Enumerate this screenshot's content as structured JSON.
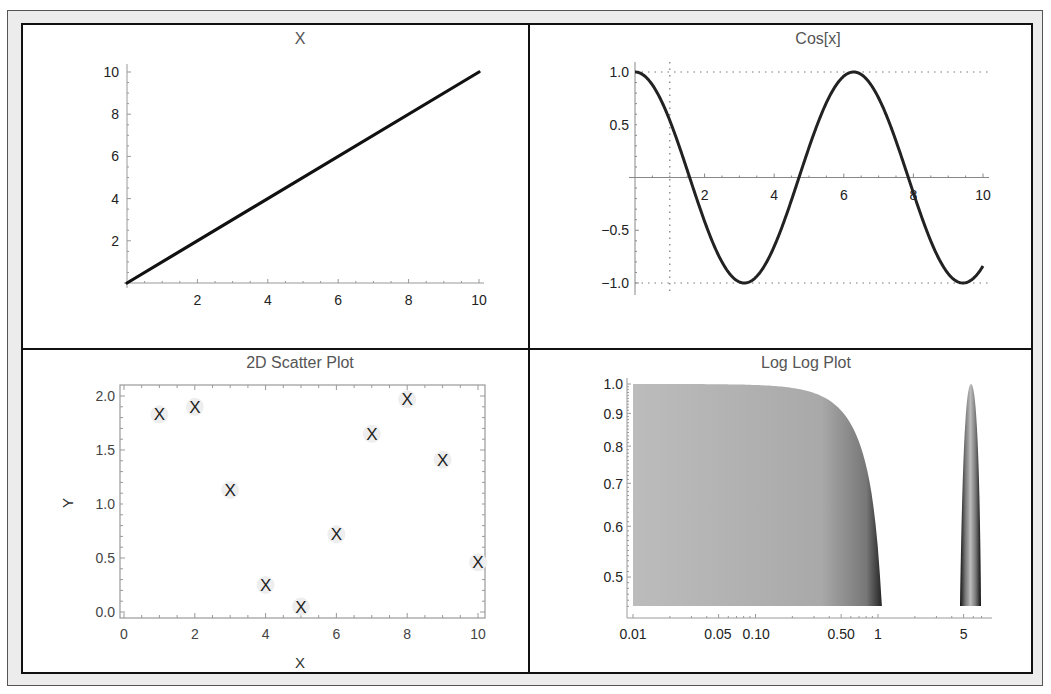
{
  "chart_data": [
    {
      "id": "linear",
      "type": "line",
      "title": "X",
      "function": "x",
      "x": [
        0,
        10
      ],
      "values": [
        0,
        10
      ],
      "xlim": [
        0,
        10
      ],
      "ylim": [
        0,
        10
      ],
      "xticks": [
        "2",
        "4",
        "6",
        "8",
        "10"
      ],
      "yticks": [
        "2",
        "4",
        "6",
        "8",
        "10"
      ],
      "xlabel": "",
      "ylabel": "",
      "grid": false,
      "line_color": "#111111"
    },
    {
      "id": "cosine",
      "type": "line",
      "title": "Cos[x]",
      "function": "cos(x)",
      "xlim": [
        0,
        10
      ],
      "ylim": [
        -1,
        1
      ],
      "xticks": [
        "2",
        "4",
        "6",
        "8",
        "10"
      ],
      "yticks": [
        "1.0",
        "0.5",
        "−0.5",
        "−1.0"
      ],
      "gridlines": {
        "horizontal": [
          1.0,
          -1.0
        ],
        "vertical": [
          1
        ],
        "style": "dotted"
      },
      "xlabel": "",
      "ylabel": "",
      "line_color": "#222222"
    },
    {
      "id": "scatter",
      "type": "scatter",
      "title": "2D Scatter Plot",
      "marker": "X",
      "x": [
        1,
        2,
        3,
        4,
        5,
        6,
        7,
        8,
        9,
        10
      ],
      "values": [
        1.83,
        1.9,
        1.13,
        0.25,
        0.05,
        0.72,
        1.65,
        1.97,
        1.41,
        0.46
      ],
      "xlim": [
        0,
        10
      ],
      "ylim": [
        0,
        2.0
      ],
      "xticks": [
        "0",
        "2",
        "4",
        "6",
        "8",
        "10"
      ],
      "yticks": [
        "0.0",
        "0.5",
        "1.0",
        "1.5",
        "2.0"
      ],
      "xlabel": "X",
      "ylabel": "Y",
      "grid": false,
      "frame": true
    },
    {
      "id": "loglog",
      "type": "area",
      "title": "Log Log Plot",
      "scale": "log-log",
      "xlim": [
        0.01,
        8
      ],
      "ylim": [
        0.45,
        1.0
      ],
      "xticks": [
        "0.01",
        "0.05",
        "0.10",
        "0.50",
        "1",
        "5"
      ],
      "yticks": [
        "1.0",
        "0.9",
        "0.8",
        "0.7",
        "0.6",
        "0.5"
      ],
      "regions": [
        {
          "name": "main",
          "x_range": [
            0.01,
            1.15
          ],
          "peak": 1.0
        },
        {
          "name": "spike",
          "x_range": [
            5,
            6.6
          ],
          "peak": 1.0
        }
      ],
      "xlabel": "",
      "ylabel": "",
      "grid": false,
      "fill_color": "#b8b8b8",
      "edge_color": "#222222"
    }
  ]
}
